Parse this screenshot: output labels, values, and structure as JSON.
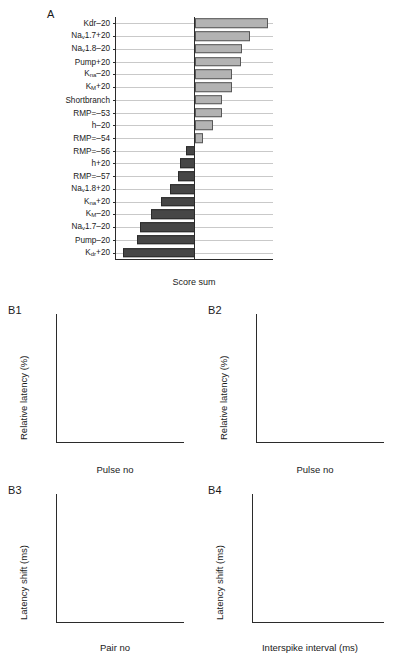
{
  "figure": {
    "panels": [
      "A",
      "B1",
      "B2",
      "B3",
      "B4"
    ]
  },
  "panelA": {
    "letter": "A",
    "xlabel": "Score sum",
    "xticks": [
      "-5",
      "0",
      "5"
    ],
    "xtick_values": [
      -5,
      0,
      5
    ],
    "colors": {
      "positive_bar": "#b3b3b3",
      "negative_bar": "#464646",
      "gridline": "#c9c9c9",
      "axis": "#2b2b2b"
    }
  },
  "chart_data": [
    {
      "id": "A",
      "type": "bar",
      "orientation": "horizontal",
      "title": "",
      "xlabel": "Score sum",
      "ylabel": "",
      "xlim": [
        -8.2,
        8.2
      ],
      "grid": true,
      "categories": [
        "Kdr-20",
        "Nav1.7+20",
        "Nav1.8-20",
        "Pump+20",
        "Kna-20",
        "KM+20",
        "Shortbranch",
        "RMP=-53",
        "h-20",
        "RMP=-54",
        "RMP=-56",
        "h+20",
        "RMP=-57",
        "Nav1.8+20",
        "Kna+20",
        "KM-20",
        "Nav1.7-20",
        "Pump-20",
        "Kdr+20"
      ],
      "categories_html": [
        "Kdr&#8211;20",
        "Na<sub>v</sub>1.7+20",
        "Na<sub>v</sub>1.8&#8211;20",
        "Pump+20",
        "K<sub>na</sub>&#8211;20",
        "K<sub>M</sub>+20",
        "Shortbranch",
        "RMP=&#8211;53",
        "h&#8211;20",
        "RMP=&#8211;54",
        "RMP=&#8211;56",
        "h+20",
        "RMP=&#8211;57",
        "Na<sub>v</sub>1.8+20",
        "K<sub>na</sub>+20",
        "K<sub>M</sub>&#8211;20",
        "Na<sub>v</sub>1.7&#8211;20",
        "Pump&#8211;20",
        "K<sub>dr</sub>+20"
      ],
      "values": [
        7.6,
        5.7,
        4.9,
        4.8,
        3.8,
        3.8,
        2.8,
        2.8,
        1.9,
        0.8,
        -0.9,
        -1.6,
        -1.8,
        -2.6,
        -3.5,
        -4.6,
        -5.7,
        -6.0,
        -7.5
      ]
    },
    {
      "id": "B1",
      "type": "line",
      "title": "",
      "xlabel": "Pulse no",
      "ylabel": "Relative latency (%)",
      "xlim": [
        0,
        360
      ],
      "ylim": [
        0,
        40
      ],
      "xticks": [
        0,
        100,
        200,
        300
      ],
      "yticks": [
        0,
        10,
        20,
        30,
        40
      ],
      "grid": false,
      "series": [
        {
          "name": "black",
          "color": "#111111",
          "x": [
            0,
            2,
            5,
            10,
            18,
            28,
            40,
            55,
            72,
            92,
            115,
            140,
            170,
            200,
            235,
            270,
            305,
            335,
            360
          ],
          "y": [
            0,
            4.0,
            7.5,
            11.5,
            16.0,
            19.8,
            22.8,
            25.4,
            27.4,
            29.0,
            30.4,
            31.5,
            32.4,
            33.2,
            33.9,
            34.5,
            35.0,
            35.4,
            35.6
          ]
        },
        {
          "name": "gray",
          "color": "#b5b5b5",
          "x": [
            0,
            2,
            5,
            10,
            18,
            28,
            40,
            55,
            72,
            92,
            115,
            140,
            170,
            200,
            235,
            270,
            305,
            335,
            360
          ],
          "y": [
            0,
            2.2,
            4.3,
            6.8,
            9.6,
            11.9,
            13.7,
            15.3,
            16.6,
            17.7,
            18.7,
            19.5,
            20.3,
            20.9,
            21.5,
            22.0,
            22.4,
            22.7,
            22.9
          ]
        }
      ]
    },
    {
      "id": "B2",
      "type": "line",
      "title": "",
      "xlabel": "Pulse no",
      "ylabel": "Relative latency (%)",
      "xlim": [
        0,
        46
      ],
      "ylim": [
        0,
        15
      ],
      "xticks": [
        0,
        20,
        40
      ],
      "yticks": [
        0,
        5,
        10,
        15
      ],
      "grid": false,
      "series": [
        {
          "name": "black",
          "color": "#111111",
          "x": [
            0,
            0.6,
            1.5,
            3,
            5,
            7,
            9,
            11,
            13,
            15,
            17,
            19,
            21
          ],
          "y": [
            0,
            1.2,
            2.5,
            4.1,
            5.6,
            6.8,
            7.8,
            8.6,
            9.6,
            10.5,
            11.3,
            12.1,
            12.8
          ]
        },
        {
          "name": "gray",
          "color": "#b5b5b5",
          "x": [
            0,
            0.8,
            2,
            4,
            6,
            9,
            12,
            15,
            18,
            21,
            24,
            27,
            30,
            33,
            36,
            39,
            41
          ],
          "y": [
            0,
            0.8,
            1.7,
            2.9,
            3.9,
            4.9,
            5.5,
            6.1,
            6.9,
            7.5,
            8.2,
            8.8,
            9.4,
            10.0,
            10.6,
            11.3,
            11.8
          ]
        }
      ]
    },
    {
      "id": "B3",
      "type": "line",
      "title": "",
      "xlabel": "Pair no",
      "ylabel": "Latency shift (ms)",
      "xlim": [
        0,
        82
      ],
      "ylim": [
        -5.2,
        1.4
      ],
      "xticks": [
        0,
        20,
        40,
        60,
        80
      ],
      "yticks": [
        0,
        -2,
        -4
      ],
      "grid": false,
      "series": [
        {
          "name": "black",
          "color": "#111111",
          "x": [
            0,
            1,
            2,
            4,
            6,
            9,
            12,
            16,
            20,
            25,
            30,
            35,
            40,
            45,
            50,
            55,
            60,
            65,
            70,
            75,
            80
          ],
          "y": [
            1.1,
            0.7,
            0.2,
            -0.4,
            -0.8,
            -1.2,
            -1.5,
            -1.9,
            -2.2,
            -2.6,
            -2.9,
            -3.2,
            -3.45,
            -3.7,
            -3.85,
            -4.1,
            -4.3,
            -4.5,
            -4.65,
            -4.85,
            -4.95
          ]
        },
        {
          "name": "gray",
          "color": "#b5b5b5",
          "x": [
            0,
            1,
            3,
            6,
            10,
            15,
            20,
            25,
            30,
            34,
            38,
            45,
            52,
            60,
            68,
            75,
            80
          ],
          "y": [
            0.45,
            0.35,
            0.2,
            0.08,
            -0.02,
            -0.12,
            -0.2,
            -0.26,
            -0.3,
            -0.45,
            -0.4,
            -0.5,
            -0.55,
            -0.62,
            -0.68,
            -0.72,
            -0.72
          ]
        }
      ]
    },
    {
      "id": "B4",
      "type": "line",
      "title": "",
      "xlabel": "Interspike interval (ms)",
      "ylabel": "Latency shift (ms)",
      "xlim": [
        8,
        104
      ],
      "ylim": [
        -3.4,
        12.0
      ],
      "xticks": [
        20,
        40,
        60,
        80,
        100
      ],
      "yticks": [
        0,
        5,
        10
      ],
      "grid": false,
      "series": [
        {
          "name": "black",
          "color": "#111111",
          "x": [
            10,
            12,
            15,
            20,
            25,
            30,
            35,
            40,
            45,
            50,
            60,
            70,
            80,
            90,
            100
          ],
          "y": [
            11.4,
            9.6,
            7.3,
            3.4,
            0.9,
            -1.4,
            -2.2,
            -2.6,
            -2.3,
            -1.9,
            -1.2,
            -0.6,
            0.1,
            0.8,
            1.3
          ]
        },
        {
          "name": "gray",
          "color": "#b5b5b5",
          "x": [
            10,
            12,
            15,
            20,
            25,
            30,
            35,
            40,
            45,
            50,
            60,
            70,
            80,
            90,
            100
          ],
          "y": [
            9.2,
            8.1,
            6.4,
            3.3,
            0.9,
            -0.6,
            -0.75,
            -0.6,
            -0.25,
            0.1,
            0.5,
            0.75,
            0.95,
            1.1,
            1.25
          ]
        }
      ]
    }
  ],
  "panelB1": {
    "letter": "B1",
    "xlabel": "Pulse no",
    "ylabel": "Relative latency (%)"
  },
  "panelB2": {
    "letter": "B2",
    "xlabel": "Pulse no",
    "ylabel": "Relative latency (%)"
  },
  "panelB3": {
    "letter": "B3",
    "xlabel": "Pair no",
    "ylabel": "Latency shift (ms)"
  },
  "panelB4": {
    "letter": "B4",
    "xlabel": "Interspike interval (ms)",
    "ylabel": "Latency shift (ms)"
  }
}
